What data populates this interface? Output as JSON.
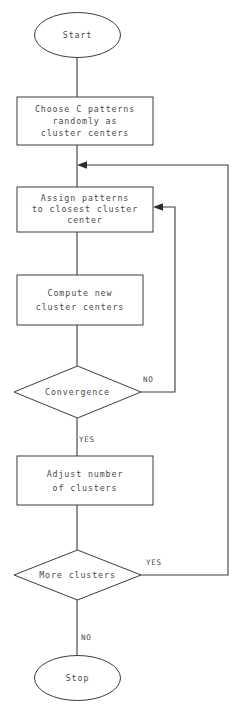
{
  "diagram": {
    "stroke_color": "#3c3c3c",
    "text_color": "#4a4a4a",
    "background_color": "#ffffff",
    "nodes": {
      "start": {
        "type": "terminator",
        "label": "Start"
      },
      "choose_centers": {
        "type": "process",
        "line1": "Choose C patterns",
        "line2": "randomly as",
        "line3": "cluster centers"
      },
      "assign_patterns": {
        "type": "process",
        "line1": "Assign patterns",
        "line2": "to closest cluster",
        "line3": "center"
      },
      "compute_centers": {
        "type": "process",
        "line1": "Compute new",
        "line2": "cluster centers"
      },
      "convergence": {
        "type": "decision",
        "label": "Convergence"
      },
      "adjust_clusters": {
        "type": "process",
        "line1": "Adjust number",
        "line2": "of clusters"
      },
      "more_clusters": {
        "type": "decision",
        "label": "More clusters"
      },
      "stop": {
        "type": "terminator",
        "label": "Stop"
      }
    },
    "edge_labels": {
      "convergence_no": "NO",
      "convergence_yes": "YES",
      "more_clusters_yes": "YES",
      "more_clusters_no": "NO"
    }
  }
}
